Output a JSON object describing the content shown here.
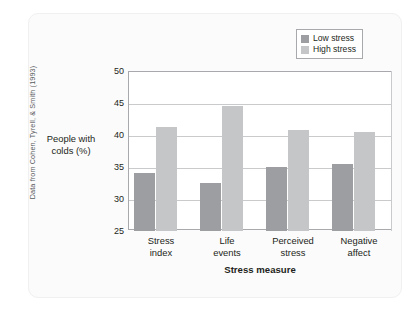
{
  "credit": "Data from Cohen, Tyrell, & Smith (1993)",
  "legend": {
    "entries": [
      {
        "label": "Low stress",
        "color": "#9c9ea1"
      },
      {
        "label": "High stress",
        "color": "#c4c6c8"
      }
    ]
  },
  "chart_data": {
    "type": "bar",
    "title": "",
    "xlabel": "Stress measure",
    "ylabel": "People with colds (%)",
    "categories": [
      [
        "Stress",
        "index"
      ],
      [
        "Life",
        "events"
      ],
      [
        "Perceived",
        "stress"
      ],
      [
        "Negative",
        "affect"
      ]
    ],
    "category_labels": [
      "Stress index",
      "Life events",
      "Perceived stress",
      "Negative affect"
    ],
    "series": [
      {
        "name": "Low stress",
        "color": "#9c9ea1",
        "values": [
          34.0,
          32.5,
          35.0,
          35.5
        ]
      },
      {
        "name": "High stress",
        "color": "#c4c6c8",
        "values": [
          41.3,
          44.6,
          40.8,
          40.4
        ]
      }
    ],
    "ylim": [
      25,
      50
    ],
    "yticks": [
      50,
      45,
      40,
      35,
      30,
      25
    ],
    "grid": true,
    "legend_position": "top-right"
  }
}
